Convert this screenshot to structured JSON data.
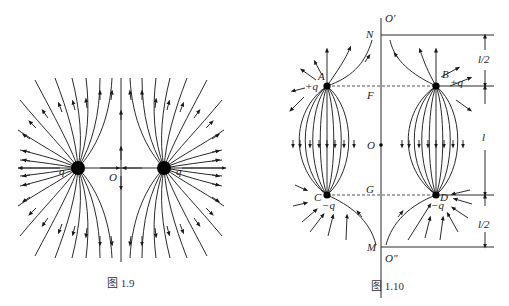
{
  "figure_1_9": {
    "caption": "图 1.9",
    "charge_left_label": "q",
    "charge_right_label": "q",
    "midpoint_label": "O",
    "description": "Electric field lines of two equal like charges q"
  },
  "figure_1_10": {
    "caption": "图 1.10",
    "axis_top_label": "O′",
    "axis_bottom_label": "O″",
    "point_N": "N",
    "point_F": "F",
    "point_O": "O",
    "point_G": "G",
    "point_M": "M",
    "charge_A_label": "A",
    "charge_A_value": "+q",
    "charge_B_label": "B",
    "charge_B_value": "+q",
    "charge_C_label": "C",
    "charge_C_value": "−q",
    "charge_D_label": "D",
    "charge_D_value": "−q",
    "dim_top": "l/2",
    "dim_middle": "l",
    "dim_bottom": "l/2"
  },
  "colors": {
    "line": "#2a2a2a",
    "charge": "#000000",
    "background": "#ffffff"
  }
}
